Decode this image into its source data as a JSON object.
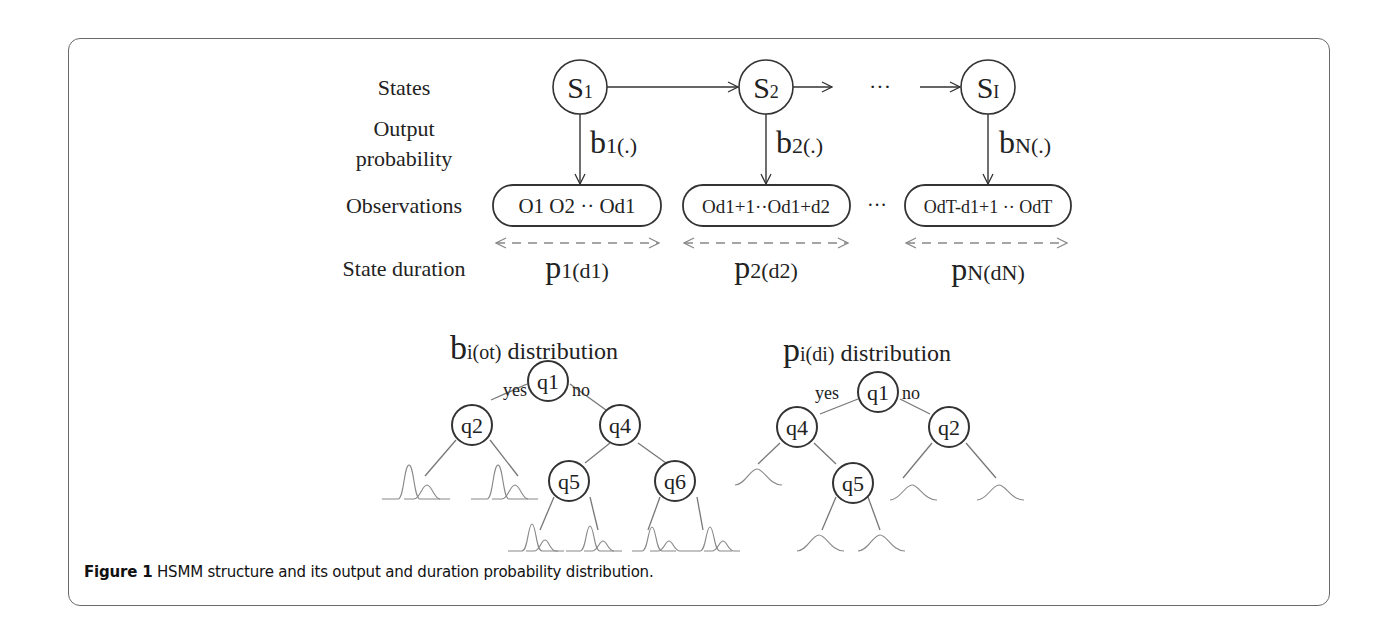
{
  "row_labels": {
    "states": "States",
    "output_1": "Output",
    "output_2": "probability",
    "observations": "Observations",
    "duration": "State duration"
  },
  "states": [
    {
      "base": "S",
      "sub": "1"
    },
    {
      "base": "S",
      "sub": "2"
    },
    {
      "base": "S",
      "sub": "I"
    }
  ],
  "ellipsis": "···",
  "output_probs": [
    {
      "base": "b",
      "sub": "1(.)"
    },
    {
      "base": "b",
      "sub": "2(.)"
    },
    {
      "base": "b",
      "sub": "N(.)"
    }
  ],
  "observations": [
    "O1 O2 ·· Od1",
    "Od1+1··Od1+d2",
    "OdT-d1+1 ·· OdT"
  ],
  "durations": [
    {
      "base": "p",
      "sub": "1(d1)"
    },
    {
      "base": "p",
      "sub": "2(d2)"
    },
    {
      "base": "p",
      "sub": "N(dN)"
    }
  ],
  "trees": [
    {
      "title_base": "b",
      "title_sub": "i(ot)",
      "title_rest": " distribution",
      "yes": "yes",
      "no": "no",
      "nodes": [
        "q1",
        "q2",
        "q4",
        "q5",
        "q6"
      ]
    },
    {
      "title_base": "p",
      "title_sub": "i(di)",
      "title_rest": " distribution",
      "yes": "yes",
      "no": "no",
      "nodes": [
        "q1",
        "q4",
        "q2",
        "q5"
      ]
    }
  ],
  "caption": {
    "figure_label": "Figure 1",
    "text": " HSMM structure and its output and duration probability distribution."
  }
}
